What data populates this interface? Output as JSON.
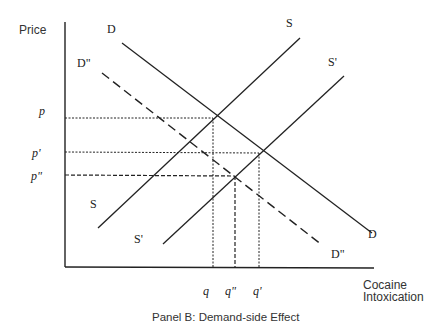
{
  "diagram": {
    "caption": "Panel B: Demand-side Effect",
    "y_axis_label": "Price",
    "x_axis_label_line1": "Cocaine",
    "x_axis_label_line2": "Intoxication",
    "price_labels": {
      "p": "p",
      "p_prime": "p'",
      "p_double": "p\""
    },
    "quantity_labels": {
      "q": "q",
      "q_double": "q\"",
      "q_prime": "q'"
    },
    "curve_labels": {
      "D_top": "D",
      "D_bottom": "D",
      "D2_top": "D\"",
      "D2_bottom": "D\"",
      "S_top": "S",
      "S_bottom": "S",
      "S1_top": "S'",
      "S1_bottom": "S'"
    },
    "curves": [
      {
        "name": "D",
        "style": "solid",
        "description": "original demand"
      },
      {
        "name": "D\"",
        "style": "dashed",
        "description": "reduced demand"
      },
      {
        "name": "S",
        "style": "solid",
        "description": "original supply"
      },
      {
        "name": "S'",
        "style": "solid",
        "description": "shifted supply"
      }
    ],
    "equilibria": [
      {
        "curves": "D & S",
        "price": "p",
        "quantity": "q"
      },
      {
        "curves": "D & S'",
        "price": "p'",
        "quantity": "q'"
      },
      {
        "curves": "D\" & S'",
        "price": "p\"",
        "quantity": "q\""
      }
    ]
  }
}
